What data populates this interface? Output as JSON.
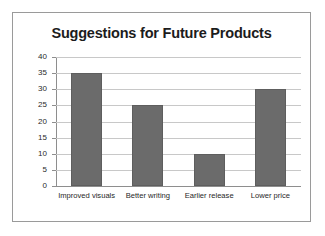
{
  "chart_data": {
    "type": "bar",
    "title": "Suggestions for Future Products",
    "xlabel": "",
    "ylabel": "",
    "categories": [
      "Improved visuals",
      "Better writing",
      "Earlier release",
      "Lower price"
    ],
    "values": [
      35,
      25,
      10,
      30
    ],
    "ylim": [
      0,
      40
    ],
    "ytick_step": 5,
    "yticks": [
      40,
      35,
      30,
      25,
      20,
      15,
      10,
      5,
      0
    ],
    "ytick_labels": [
      "40",
      "35",
      "30",
      "25",
      "20",
      "15",
      "10",
      "5",
      "0"
    ],
    "grid": true,
    "legend": false,
    "legend_position": "none",
    "bar_color": "#6b6b6b",
    "gridline_color": "#c8c8c8",
    "axis_color": "#8e8e8e",
    "background_color": "#ffffff",
    "frame_color": "#9a9a9a",
    "title_color": "#1c1c1c"
  }
}
